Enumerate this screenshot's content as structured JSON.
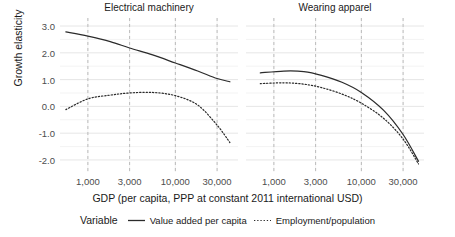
{
  "chart_data": {
    "type": "line",
    "title": "",
    "xlabel": "GDP (per capita, PPP at constant 2011 international USD)",
    "ylabel": "Growth elasticity",
    "x_scale": "log",
    "xticks": [
      1000,
      3000,
      10000,
      30000
    ],
    "xtick_labels": [
      "1,000",
      "3,000",
      "10,000",
      "30,000"
    ],
    "yticks": [
      3.0,
      2.0,
      1.0,
      0.0,
      -1.0,
      -2.0
    ],
    "ytick_labels": [
      "3.0",
      "2.0",
      "1.0",
      "0.0",
      "-1.0",
      "-2.0"
    ],
    "ylim": [
      -2.45,
      3.3
    ],
    "xlim": [
      480,
      52000
    ],
    "grid": true,
    "legend_position": "bottom",
    "legend_title": "Variable",
    "facets": [
      {
        "label": "Electrical machinery",
        "series": [
          {
            "name": "Value added per capita",
            "style": "solid",
            "x": [
              560,
              1000,
              1800,
              3000,
              5500,
              10000,
              18000,
              30000,
              42000
            ],
            "y": [
              2.78,
              2.62,
              2.42,
              2.18,
              1.92,
              1.62,
              1.32,
              1.04,
              0.92
            ]
          },
          {
            "name": "Employment/population",
            "style": "dotted",
            "x": [
              560,
              1000,
              1800,
              3000,
              5500,
              10000,
              18000,
              30000,
              42000
            ],
            "y": [
              -0.12,
              0.28,
              0.42,
              0.5,
              0.52,
              0.4,
              0.05,
              -0.7,
              -1.35
            ]
          }
        ]
      },
      {
        "label": "Wearing apparel",
        "series": [
          {
            "name": "Value added per capita",
            "style": "solid",
            "x": [
              700,
              1300,
              2200,
              3500,
              6000,
              10000,
              18000,
              30000,
              45000
            ],
            "y": [
              1.25,
              1.32,
              1.3,
              1.16,
              0.9,
              0.52,
              -0.15,
              -1.05,
              -2.05
            ]
          },
          {
            "name": "Employment/population",
            "style": "dotted",
            "x": [
              700,
              1300,
              2200,
              3500,
              6000,
              10000,
              18000,
              30000,
              45000
            ],
            "y": [
              0.85,
              0.88,
              0.83,
              0.7,
              0.46,
              0.12,
              -0.45,
              -1.22,
              -2.15
            ]
          }
        ]
      }
    ],
    "legend_entries": [
      {
        "label": "Value added per capita",
        "style": "solid"
      },
      {
        "label": "Employment/population",
        "style": "dotted"
      }
    ],
    "colors": {
      "line": "#2b2b2b",
      "grid_major": "#e3e3e3",
      "grid_panel_dashed": "#b3b3b3",
      "background": "#ffffff",
      "text": "#1a1a1a",
      "tick_text": "#4d4d4d"
    }
  }
}
